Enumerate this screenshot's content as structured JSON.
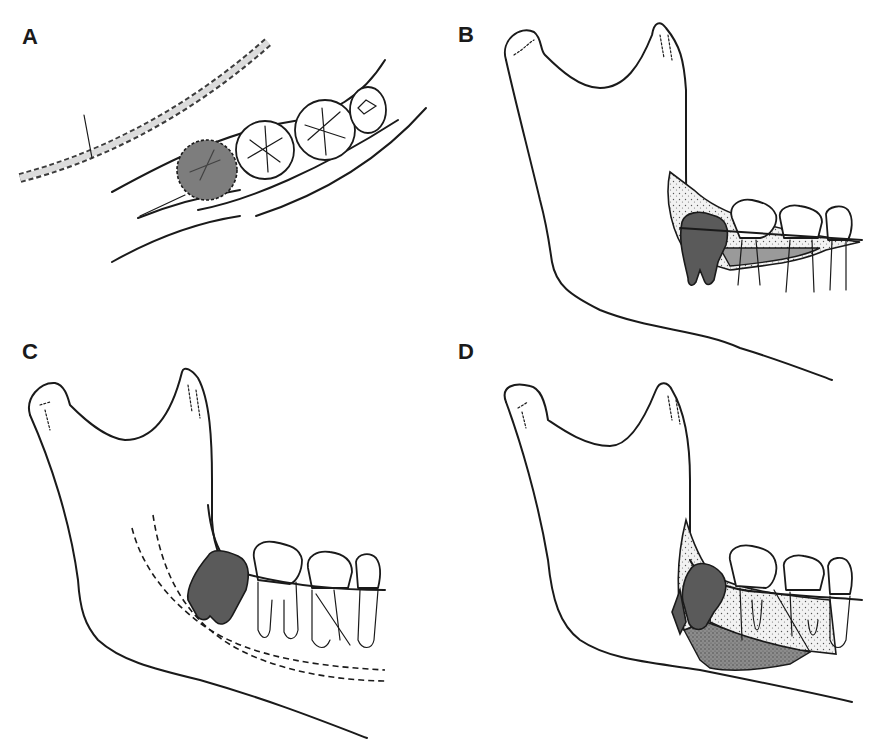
{
  "figure": {
    "panels": [
      {
        "id": "A",
        "label": "A",
        "view": "occlusal view of posterior mandibular arch with impacted third molar (shaded, dashed outline) and stippled incision line"
      },
      {
        "id": "B",
        "label": "B",
        "view": "lateral mandible, buccal flap outline with stippled bone and gray cortical window over impacted molar"
      },
      {
        "id": "C",
        "label": "C",
        "view": "lateral mandible, impacted molar with dashed inferior alveolar canal"
      },
      {
        "id": "D",
        "label": "D",
        "view": "lateral mandible, extended flap with stippled and dark-stippled bone regions"
      }
    ],
    "colors": {
      "line": "#1a1a1a",
      "impacted_tooth": "#5a5a5a",
      "cortical_window": "#9a9a9a",
      "background": "#ffffff"
    }
  }
}
